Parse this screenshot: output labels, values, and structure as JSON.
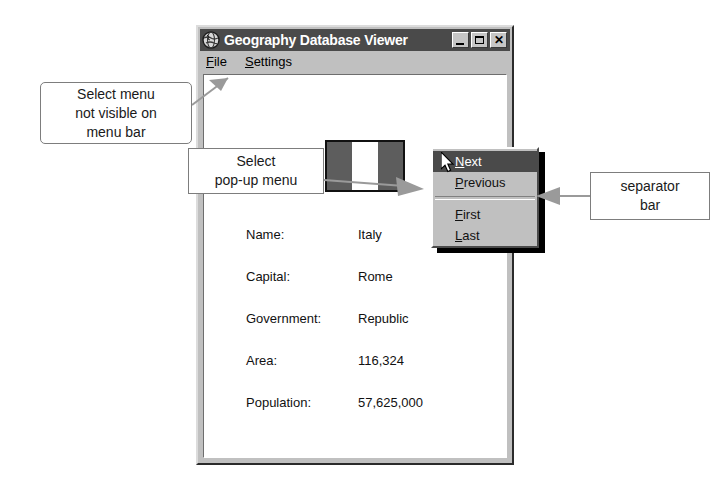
{
  "window": {
    "title": "Geography Database Viewer",
    "icon": "globe-icon",
    "buttons": {
      "minimize": "_",
      "maximize": "□",
      "close": "✕"
    },
    "menubar": [
      {
        "label": "File",
        "accel": "F"
      },
      {
        "label": "Settings",
        "accel": "S"
      }
    ]
  },
  "record": {
    "flag_alt": "italy-flag",
    "fields": [
      {
        "label": "Name:",
        "value": "Italy"
      },
      {
        "label": "Capital:",
        "value": "Rome"
      },
      {
        "label": "Government:",
        "value": "Republic"
      },
      {
        "label": "Area:",
        "value": "116,324"
      },
      {
        "label": "Population:",
        "value": "57,625,000"
      }
    ]
  },
  "popup_menu": {
    "items": [
      {
        "label": "Next",
        "accel": "N",
        "selected": true
      },
      {
        "label": "Previous",
        "accel": "P",
        "selected": false
      },
      {
        "label": "First",
        "accel": "F",
        "selected": false
      },
      {
        "label": "Last",
        "accel": "L",
        "selected": false
      }
    ],
    "separator_after_index": 1
  },
  "annotations": [
    {
      "id": "menu-hidden",
      "lines": [
        "Select menu",
        "not visible on",
        "menu bar"
      ]
    },
    {
      "id": "popup-menu",
      "lines": [
        "Select",
        "pop-up menu"
      ]
    },
    {
      "id": "separator",
      "lines": [
        "separator",
        "bar"
      ]
    }
  ],
  "colors": {
    "window_face": "#c0c0c0",
    "titlebar": "#4a4a4a",
    "highlight": "#4a4a4a",
    "client": "#ffffff",
    "annotation_line": "#9a9a9a",
    "flag_band": "#5d5d5d"
  }
}
